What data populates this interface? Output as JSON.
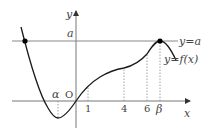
{
  "diagram": {
    "axes": {
      "x_label": "x",
      "y_label": "y",
      "origin_label": "O"
    },
    "line_label": "y=a",
    "curve_label": "y=f(x)",
    "y_tick_label": "a",
    "x_ticks": [
      {
        "label": "α",
        "italic": true
      },
      {
        "label": "1",
        "italic": false
      },
      {
        "label": "4",
        "italic": false
      },
      {
        "label": "6",
        "italic": false
      },
      {
        "label": "β",
        "italic": true
      }
    ],
    "colors": {
      "curve": "#1a1a1a",
      "axis": "#777777",
      "line": "#888888",
      "dots": "#000000",
      "guides": "#888888"
    }
  }
}
